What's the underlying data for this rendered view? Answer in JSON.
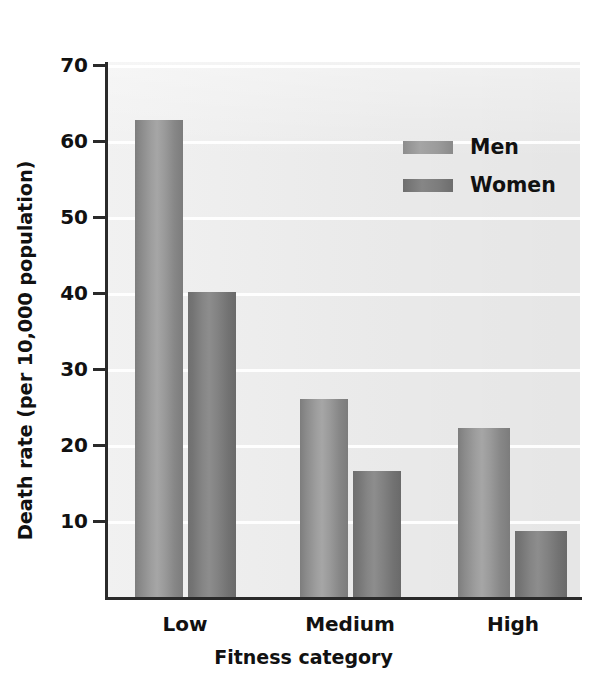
{
  "chart_data": {
    "type": "bar",
    "title": "",
    "xlabel": "Fitness category",
    "ylabel": "Death rate (per 10,000 population)",
    "categories": [
      "Low",
      "Medium",
      "High"
    ],
    "series": [
      {
        "name": "Men",
        "values": [
          62.8,
          26.0,
          22.3
        ]
      },
      {
        "name": "Women",
        "values": [
          40.2,
          16.6,
          8.7
        ]
      }
    ],
    "ylim": [
      0,
      70
    ],
    "yticks": [
      10,
      20,
      30,
      40,
      50,
      60,
      70
    ],
    "ytick_labels": [
      "10",
      "20",
      "30",
      "40",
      "50",
      "60",
      "70"
    ],
    "grid": "horizontal-faint-white",
    "legend_position": "upper-right-inside",
    "plot_background": "#ededed",
    "colors": {
      "men": "#9e9e9e",
      "women": "#808080",
      "axis": "#2a2a2a",
      "text": "#111111"
    }
  },
  "axis": {
    "y_title": "Death rate (per 10,000 population)",
    "x_title": "Fitness category"
  },
  "ticks": {
    "labels": [
      "70",
      "60",
      "50",
      "40",
      "30",
      "20",
      "10"
    ]
  },
  "legend": {
    "items": [
      {
        "label": "Men",
        "swatch": "men-swatch"
      },
      {
        "label": "Women",
        "swatch": "women-swatch"
      }
    ]
  },
  "categories": [
    {
      "label": "Low"
    },
    {
      "label": "Medium"
    },
    {
      "label": "High"
    }
  ]
}
